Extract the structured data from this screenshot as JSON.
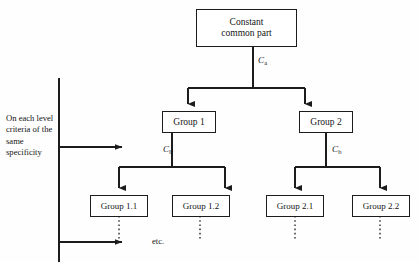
{
  "diagram": {
    "background_color": "#fefefe",
    "line_color": "#1c1c1c",
    "text_color": "#141414",
    "side_caption": "On each level criteria of the same specificity",
    "etc_label": "etc.",
    "nodes": {
      "root": {
        "line1": "Constant",
        "line2": "common part"
      },
      "level1": [
        {
          "label": "Group 1"
        },
        {
          "label": "Group 2"
        }
      ],
      "level2": [
        {
          "label": "Group 1.1"
        },
        {
          "label": "Group 1.2"
        },
        {
          "label": "Group 2.1"
        },
        {
          "label": "Group 2.2"
        }
      ]
    },
    "edge_labels": {
      "root_split": {
        "base": "C",
        "sub": "a"
      },
      "group1_split": {
        "base": "C",
        "sub": "b"
      },
      "group2_split": {
        "base": "C",
        "sub": "b"
      }
    }
  }
}
